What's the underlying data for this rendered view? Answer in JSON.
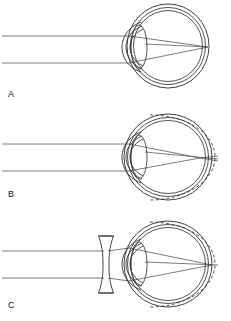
{
  "figure": {
    "background_color": "#ffffff",
    "line_color": "#333333",
    "ray_color": "#5a5a5a",
    "dashed_outline_color": "#3a3a3a",
    "width": 231,
    "height": 321
  },
  "panels": [
    {
      "id": "A",
      "label": "A",
      "caption": "Normal (emmetropic) eye: parallel rays focus on the retina",
      "condition": "normal",
      "has_dashed_outline": false,
      "has_corrective_lens": false,
      "focus_location": "on-retina",
      "ray_count": 2,
      "eye": {
        "sclera_outer_rx": 41,
        "sclera_outer_ry": 42,
        "center_x": 168,
        "center_y": 46,
        "cornea_arc": true,
        "crystalline_lens": true
      }
    },
    {
      "id": "B",
      "label": "B",
      "caption": "Myopic eye: elongated globe, rays focus in front of the retina",
      "condition": "myopia-uncorrected",
      "has_dashed_outline": true,
      "has_corrective_lens": false,
      "focus_location": "in-front-of-retina",
      "ray_count": 2,
      "eye": {
        "sclera_outer_rx": 44,
        "sclera_outer_ry": 43,
        "center_x": 170,
        "center_y": 155,
        "cornea_arc": true,
        "crystalline_lens": true
      }
    },
    {
      "id": "C",
      "label": "C",
      "caption": "Myopic eye corrected by a biconcave (diverging) lens: rays focus on the retina",
      "condition": "myopia-corrected",
      "has_dashed_outline": true,
      "has_corrective_lens": true,
      "corrective_lens": {
        "type": "biconcave",
        "name": "concave-corrective-lens",
        "center_x": 106,
        "top_y": 236,
        "bottom_y": 292,
        "waist_half_width": 3.2,
        "rim_half_width": 7.5
      },
      "focus_location": "on-retina",
      "ray_count": 2,
      "eye": {
        "sclera_outer_rx": 44,
        "sclera_outer_ry": 43,
        "center_x": 170,
        "center_y": 264,
        "cornea_arc": true,
        "crystalline_lens": true
      }
    }
  ],
  "labels": {
    "a": "A",
    "b": "B",
    "c": "C"
  }
}
